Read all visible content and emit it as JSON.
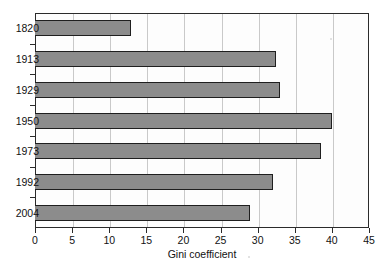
{
  "chart_data": {
    "type": "bar",
    "orientation": "horizontal",
    "title": "",
    "xlabel": "Gini coefficient",
    "ylabel": "",
    "categories": [
      "1820",
      "1913",
      "1929",
      "1950",
      "1973",
      "1992",
      "2004"
    ],
    "values": [
      13,
      32.5,
      33,
      40,
      38.5,
      32,
      29
    ],
    "series": [
      {
        "name": "Gini coefficient",
        "values": [
          13,
          32.5,
          33,
          40,
          38.5,
          32,
          29
        ]
      }
    ],
    "xlim": [
      0,
      45
    ],
    "xticks": [
      0,
      5,
      10,
      15,
      20,
      25,
      30,
      35,
      40,
      45
    ],
    "xtick_labels": [
      "0",
      "5",
      "10",
      "15",
      "20",
      "25",
      "30",
      "35",
      "40",
      "45"
    ],
    "grid": "vertical",
    "legend": "none",
    "bar_color": "#8c8c8c",
    "bar_edge_color": "#1f1f1f",
    "grid_color": "#c9c9c9",
    "frame_color": "#2b2b2b",
    "background_color": "#ffffff"
  }
}
